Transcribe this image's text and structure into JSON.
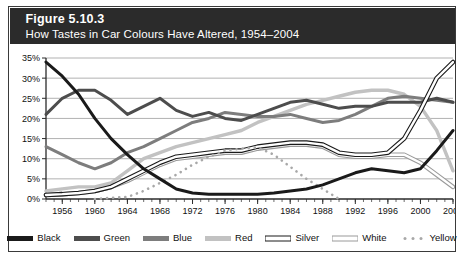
{
  "figure": {
    "number": "Figure 5.10.3",
    "subtitle": "How Tastes in Car Colours Have Altered, 1954–2004"
  },
  "colors": {
    "header_bg": "#2b2b2b",
    "frame": "#3a3a3a",
    "plot_bg": "#ffffff",
    "grid": "#8f8f8f",
    "axis": "#2b2b2b",
    "black_series": "#1a1a1a",
    "green_series": "#4d4d4d",
    "blue_series": "#7d7d7d",
    "red_series": "#c2c2c2",
    "silver_series": "#ffffff",
    "silver_outline": "#1a1a1a",
    "white_series": "#ffffff",
    "white_outline": "#9a9a9a",
    "yellow_series": "#a8a8a8"
  },
  "legend": {
    "items": [
      {
        "label": "Black",
        "style": "solid",
        "key": "black"
      },
      {
        "label": "Green",
        "style": "solid",
        "key": "green"
      },
      {
        "label": "Blue",
        "style": "solid",
        "key": "blue"
      },
      {
        "label": "Red",
        "style": "solid",
        "key": "red"
      },
      {
        "label": "Silver",
        "style": "double",
        "key": "silver"
      },
      {
        "label": "White",
        "style": "double",
        "key": "white"
      },
      {
        "label": "Yellow",
        "style": "dotted",
        "key": "yellow"
      }
    ]
  },
  "chart_data": {
    "type": "line",
    "title": "How Tastes in Car Colours Have Altered, 1954–2004",
    "xlabel": "",
    "ylabel": "",
    "xlim": [
      1954,
      2004
    ],
    "ylim": [
      0,
      35
    ],
    "ytick_step": 5,
    "ytick_labels": [
      "0%",
      "5%",
      "10%",
      "15%",
      "20%",
      "25%",
      "30%",
      "35%"
    ],
    "xtick_labels": [
      "1956",
      "1960",
      "1964",
      "1968",
      "1972",
      "1976",
      "1980",
      "1984",
      "1988",
      "1992",
      "1996",
      "2000",
      "2004"
    ],
    "xticks": [
      1956,
      1960,
      1964,
      1968,
      1972,
      1976,
      1980,
      1984,
      1988,
      1992,
      1996,
      2000,
      2004
    ],
    "minor_tick_step": 1,
    "grid": "horizontal",
    "legend_position": "bottom",
    "x": [
      1954,
      1956,
      1958,
      1960,
      1962,
      1964,
      1966,
      1968,
      1970,
      1972,
      1974,
      1976,
      1978,
      1980,
      1982,
      1984,
      1986,
      1988,
      1990,
      1992,
      1994,
      1996,
      1998,
      2000,
      2002,
      2004
    ],
    "series": [
      {
        "name": "Black",
        "values": [
          34,
          30.5,
          26,
          20,
          15,
          11,
          7.5,
          5,
          2.5,
          1.5,
          1.2,
          1.2,
          1.2,
          1.2,
          1.5,
          2,
          2.5,
          3.5,
          5,
          6.5,
          7.5,
          7,
          6.5,
          7.5,
          12,
          17
        ]
      },
      {
        "name": "Green",
        "values": [
          21,
          25,
          27,
          27,
          24.5,
          21,
          23,
          25,
          22,
          20.5,
          21.5,
          20,
          19.5,
          21,
          22.5,
          24,
          24.5,
          23.5,
          22.5,
          23,
          23,
          24,
          24,
          24,
          25,
          24
        ]
      },
      {
        "name": "Blue",
        "values": [
          13,
          11,
          9,
          7.5,
          9,
          11.5,
          13,
          15,
          17,
          19,
          20,
          21.5,
          21,
          20.5,
          20.5,
          21,
          20,
          19,
          19.5,
          21,
          23,
          25,
          25.5,
          25,
          24.5,
          24
        ]
      },
      {
        "name": "Red",
        "values": [
          2,
          2.5,
          3,
          3,
          4,
          7,
          10,
          11.5,
          13,
          14,
          15,
          16,
          17,
          19,
          20.5,
          22,
          23.5,
          24.5,
          25.5,
          26.5,
          27,
          27,
          26,
          23,
          17,
          7
        ]
      },
      {
        "name": "Silver",
        "values": [
          1,
          1.2,
          1.5,
          2,
          3,
          5,
          7,
          9,
          10.5,
          11,
          11.5,
          12,
          12,
          13,
          13.5,
          14,
          14,
          13.5,
          11.5,
          11,
          11,
          11.5,
          15,
          22,
          30,
          34
        ]
      },
      {
        "name": "White",
        "values": [
          1,
          1.2,
          1.5,
          2,
          3,
          4.5,
          6.5,
          8.5,
          10,
          10.5,
          11,
          11.5,
          11.5,
          12.5,
          13,
          13.5,
          13.5,
          13,
          11,
          10.5,
          10.5,
          11,
          11,
          9,
          6,
          3
        ]
      },
      {
        "name": "Yellow",
        "values": [
          0,
          0,
          0,
          0,
          0.3,
          0.5,
          2,
          4,
          6,
          8.5,
          10.5,
          12,
          12.5,
          12.8,
          11,
          8,
          5,
          2.5,
          0,
          0,
          0,
          0,
          0,
          0,
          0,
          0
        ]
      }
    ]
  }
}
